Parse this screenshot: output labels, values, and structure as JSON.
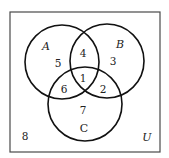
{
  "diagram": {
    "type": "venn",
    "universe": {
      "label": "U",
      "box": {
        "x": 10,
        "y": 12,
        "width": 150,
        "height": 140
      },
      "outside_region_label": "8",
      "outside_region_pos": [
        25,
        140
      ],
      "label_pos": [
        147,
        141
      ]
    },
    "sets": [
      {
        "name": "A",
        "cx": 62,
        "cy": 62,
        "r": 37,
        "label_pos": [
          46,
          50
        ],
        "italic": true
      },
      {
        "name": "B",
        "cx": 107,
        "cy": 61,
        "r": 37,
        "label_pos": [
          120,
          48
        ],
        "italic": true
      },
      {
        "name": "C",
        "cx": 85,
        "cy": 104,
        "r": 37,
        "label_pos": [
          84,
          132
        ],
        "italic": false
      }
    ],
    "regions": [
      {
        "id": "A_only",
        "label": "5",
        "pos": [
          58,
          67
        ]
      },
      {
        "id": "A_and_B_only",
        "label": "4",
        "pos": [
          83,
          57
        ]
      },
      {
        "id": "B_only",
        "label": "3",
        "pos": [
          113,
          65
        ]
      },
      {
        "id": "A_and_B_and_C",
        "label": "1",
        "pos": [
          83,
          82
        ]
      },
      {
        "id": "A_and_C_only",
        "label": "6",
        "pos": [
          64,
          93
        ]
      },
      {
        "id": "B_and_C_only",
        "label": "2",
        "pos": [
          103,
          93
        ]
      },
      {
        "id": "C_only",
        "label": "7",
        "pos": [
          83,
          114
        ]
      },
      {
        "id": "outside",
        "label": "8",
        "pos": [
          25,
          140
        ]
      }
    ],
    "colors": {
      "circle_stroke": "#111111",
      "box_stroke": "#4a4a4a",
      "text": "#222222",
      "background": "#ffffff"
    }
  }
}
